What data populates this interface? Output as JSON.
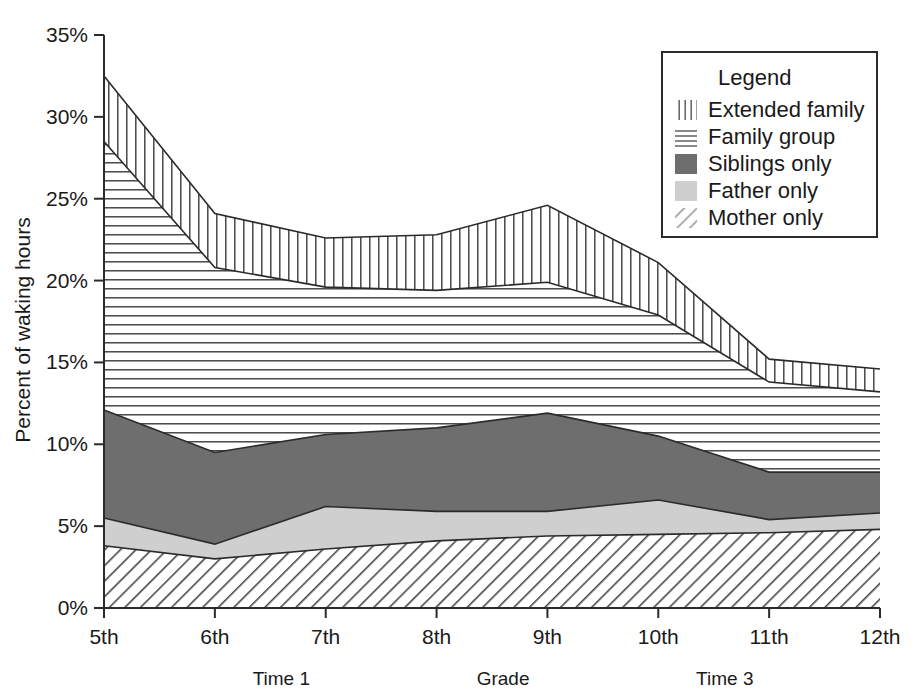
{
  "chart_data": {
    "type": "area",
    "title": "",
    "subtitle": "",
    "xlabel": "Grade",
    "ylabel": "Percent of waking hours",
    "stacked": true,
    "grid": false,
    "xlim": [
      5,
      12
    ],
    "ylim": [
      0,
      35
    ],
    "y_ticks": [
      "0%",
      "5%",
      "10%",
      "15%",
      "20%",
      "25%",
      "30%",
      "35%"
    ],
    "y_tick_values": [
      0,
      5,
      10,
      15,
      20,
      25,
      30,
      35
    ],
    "categories": [
      "5th",
      "6th",
      "7th",
      "8th",
      "9th",
      "10th",
      "11th",
      "12th"
    ],
    "x_values": [
      5,
      6,
      7,
      8,
      9,
      10,
      11,
      12
    ],
    "legend": {
      "title": "Legend",
      "position": "top-right",
      "entries": [
        {
          "label": "Extended family",
          "pattern": "vertical-lines"
        },
        {
          "label": "Family group",
          "pattern": "horizontal-lines"
        },
        {
          "label": "Siblings only",
          "pattern": "solid-dark-gray",
          "color": "#6e6e6e"
        },
        {
          "label": "Father only",
          "pattern": "solid-light-gray",
          "color": "#cfcfcf"
        },
        {
          "label": "Mother only",
          "pattern": "diagonal-hatch"
        }
      ]
    },
    "series": [
      {
        "name": "Mother only",
        "pattern": "diagonal-hatch",
        "values": [
          3.8,
          3.0,
          3.6,
          4.1,
          4.4,
          4.5,
          4.6,
          4.8
        ]
      },
      {
        "name": "Father only",
        "pattern": "solid-light-gray",
        "color": "#cfcfcf",
        "values": [
          1.7,
          0.9,
          2.6,
          1.8,
          1.5,
          2.1,
          0.8,
          1.0
        ]
      },
      {
        "name": "Siblings only",
        "pattern": "solid-dark-gray",
        "color": "#6e6e6e",
        "values": [
          6.6,
          5.6,
          4.4,
          5.1,
          6.0,
          3.9,
          2.9,
          2.5
        ]
      },
      {
        "name": "Family group",
        "pattern": "horizontal-lines",
        "values": [
          16.4,
          11.3,
          9.0,
          8.4,
          8.0,
          7.4,
          5.5,
          4.9
        ]
      },
      {
        "name": "Extended family",
        "pattern": "vertical-lines",
        "values": [
          4.0,
          3.3,
          3.0,
          3.4,
          4.7,
          3.2,
          1.4,
          1.4
        ]
      }
    ],
    "cumulative_tops": {
      "mother_only": [
        3.8,
        3.0,
        3.6,
        4.1,
        4.4,
        4.5,
        4.6,
        4.8
      ],
      "father_only": [
        5.5,
        3.9,
        6.2,
        5.9,
        5.9,
        6.6,
        5.4,
        5.8
      ],
      "siblings_only": [
        12.1,
        9.5,
        10.6,
        11.0,
        11.9,
        10.5,
        8.3,
        8.3
      ],
      "family_group": [
        28.5,
        20.8,
        19.6,
        19.4,
        19.9,
        17.9,
        13.8,
        13.2
      ],
      "extended_family": [
        32.5,
        24.1,
        22.6,
        22.8,
        24.6,
        21.1,
        15.2,
        14.6
      ]
    },
    "annotations": [
      {
        "text": "Time 1",
        "x_position": 6.6
      },
      {
        "text": "Grade",
        "x_position": 8.6
      },
      {
        "text": "Time 3",
        "x_position": 10.6
      }
    ]
  }
}
